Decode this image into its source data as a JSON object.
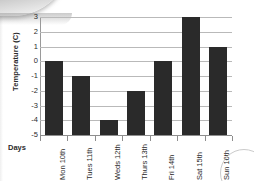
{
  "chart_data": {
    "type": "bar",
    "title": "",
    "xlabel": "Days",
    "ylabel": "Temperature (C)",
    "categories": [
      "Mon 10th",
      "Tues 11th",
      "Weds 12th",
      "Thurs 13th",
      "Fri 14th",
      "Sat 15th",
      "Sun 16th"
    ],
    "values": [
      0,
      -1,
      -4,
      -2,
      0,
      3,
      1
    ],
    "ylim": [
      -5,
      3
    ],
    "y_ticks": [
      3,
      2,
      1,
      0,
      -1,
      -2,
      -3,
      -4,
      -5
    ],
    "y_tick_labels": [
      "3",
      "2",
      "1",
      "0",
      "-1",
      "-2",
      "-3",
      "-4",
      "-5"
    ],
    "baseline": -5,
    "grid": true,
    "legend": false,
    "legend_position": "none",
    "bar_color": "#2a2a2a",
    "gridline_color": "#b9b9b9",
    "background_color": "#ffffff"
  },
  "artifacts": {
    "top_left_shadow": "scan-page-shadow",
    "bottom_right_arc": "scan-circle-artifact"
  }
}
